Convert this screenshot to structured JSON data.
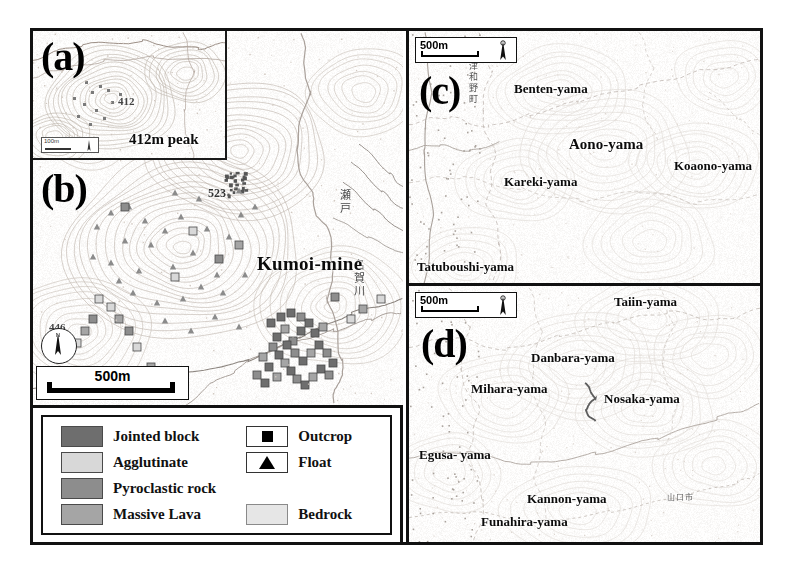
{
  "figure": {
    "panels": {
      "a": {
        "letter": "(a)",
        "labels": [
          {
            "name": "peak-label",
            "text": "412m peak"
          },
          {
            "name": "spot-height",
            "text": "412"
          }
        ],
        "scalebar": {
          "text": "100m",
          "north_arrow": "N"
        }
      },
      "b": {
        "letter": "(b)",
        "labels": [
          {
            "name": "mine-label",
            "text": "Kumoi-mine"
          },
          {
            "name": "spot-height-523",
            "text": "523"
          },
          {
            "name": "spot-height-446",
            "text": "446"
          },
          {
            "name": "river-seto",
            "text": "瀬戸"
          },
          {
            "name": "river-naga",
            "text": "名賀川"
          }
        ],
        "scalebar": {
          "text": "500m",
          "north_arrow": "N"
        }
      },
      "c": {
        "letter": "(c)",
        "scalebar": {
          "text": "500m",
          "north_arrow": "N"
        },
        "town": "津和野町",
        "labels": [
          {
            "name": "benten-yama",
            "text": "Benten-yama"
          },
          {
            "name": "aono-yama",
            "text": "Aono-yama"
          },
          {
            "name": "koaono-yama",
            "text": "Koaono-yama"
          },
          {
            "name": "kareki-yama",
            "text": "Kareki-yama"
          },
          {
            "name": "tatuboushi-yama",
            "text": "Tatuboushi-yama"
          }
        ]
      },
      "d": {
        "letter": "(d)",
        "scalebar": {
          "text": "500m",
          "north_arrow": "N"
        },
        "city": "山口市",
        "labels": [
          {
            "name": "taiin-yama",
            "text": "Taiin-yama"
          },
          {
            "name": "danbara-yama",
            "text": "Danbara-yama"
          },
          {
            "name": "mihara-yama",
            "text": "Mihara-yama"
          },
          {
            "name": "nosaka-yama",
            "text": "Nosaka-yama"
          },
          {
            "name": "egusa-yama",
            "text": "Egusa-\nyama"
          },
          {
            "name": "kannon-yama",
            "text": "Kannon-yama"
          },
          {
            "name": "funahira-yama",
            "text": "Funahira-yama"
          }
        ]
      }
    },
    "legend": {
      "left_items": [
        {
          "label": "Jointed block",
          "swatch": "#6e6e6e",
          "kind": "fill"
        },
        {
          "label": "Agglutinate",
          "swatch": "#d8d8d8",
          "kind": "fill"
        },
        {
          "label": "Pyroclastic rock",
          "swatch": "#8d8d8d",
          "kind": "fill"
        },
        {
          "label": "Massive Lava",
          "swatch": "#a5a5a5",
          "kind": "fill"
        }
      ],
      "right_items": [
        {
          "label": "Outcrop",
          "kind": "square-symbol"
        },
        {
          "label": "Float",
          "kind": "triangle-symbol"
        },
        {
          "label": "Bedrock",
          "swatch": "#e6e6e6",
          "kind": "fill"
        }
      ]
    },
    "colors": {
      "frame": "#111111",
      "paper": "#ffffff",
      "contour": "#b0a8a0",
      "text": "#0b0b0b"
    }
  }
}
